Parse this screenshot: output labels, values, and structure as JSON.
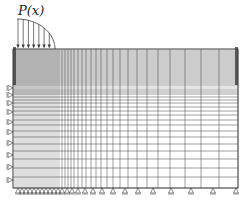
{
  "figure": {
    "type": "finite-element-mesh",
    "load_label": "P(x)",
    "load_shape": "quarter-ellipse distributed pressure",
    "load_arrow_count": 7,
    "domain": {
      "left": 13,
      "right": 238,
      "top": 49,
      "bottom": 188
    },
    "load": {
      "x_start": 17,
      "x_end": 55,
      "top_y": 19
    },
    "colors": {
      "line": "#3a3a3a",
      "dense": "#555555",
      "background": "#ffffff"
    },
    "boundary_conditions": {
      "left_edge": "roller supports (horizontal)",
      "bottom_edge": "roller supports (vertical)"
    },
    "mesh": {
      "x_lines": [
        13,
        15,
        17,
        19,
        21,
        23,
        25,
        27,
        29,
        31,
        33,
        35,
        37,
        39,
        41,
        43,
        45,
        47,
        49,
        51,
        53,
        55,
        57,
        59,
        62,
        65,
        68,
        71,
        74,
        78,
        82,
        86,
        91,
        96,
        101,
        107,
        113,
        120,
        128,
        137,
        147,
        158,
        170,
        185,
        201,
        219,
        238
      ],
      "y_lines": [
        49,
        50,
        51,
        52,
        53,
        54,
        55,
        56,
        57,
        58,
        59,
        60,
        61,
        62,
        63,
        64,
        65,
        66,
        67,
        68,
        69,
        70,
        71,
        72,
        73,
        74,
        75,
        76,
        77,
        78,
        79,
        80,
        81,
        82,
        83,
        84,
        85,
        86,
        88,
        90,
        92,
        94,
        97,
        100,
        103,
        107,
        111,
        115,
        120,
        125,
        131,
        137,
        144,
        151,
        159,
        168,
        177,
        188
      ],
      "bottom_support_x": [
        18,
        22,
        26,
        30,
        34,
        38,
        42,
        46,
        50,
        54,
        58,
        62,
        67,
        72,
        78,
        85,
        93,
        102,
        113,
        125,
        138,
        153,
        171,
        191,
        213,
        236
      ],
      "left_support_y": [
        88,
        95,
        103,
        112,
        122,
        132,
        143,
        155,
        167,
        180
      ]
    }
  }
}
